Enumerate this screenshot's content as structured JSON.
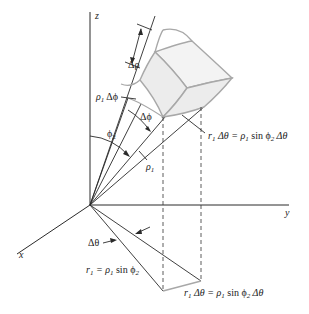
{
  "diagram": {
    "axes": {
      "x_label": "x",
      "y_label": "y",
      "z_label": "z"
    },
    "labels": {
      "delta_rho": "Δρ",
      "rho1_delta_phi_rho": "ρ",
      "rho1_delta_phi_sub": "1",
      "rho1_delta_phi_rest": " Δϕ",
      "delta_phi": "Δϕ",
      "phi2_main": "ϕ",
      "phi2_sub": "2",
      "rho1_main": "ρ",
      "rho1_sub": "1",
      "delta_theta": "Δθ",
      "r1_eq_r": "r",
      "r1_eq_sub1": "1",
      "r1_eq_mid": " = ρ",
      "r1_eq_sub2": "1",
      "r1_eq_sin": " sin ϕ",
      "r1_eq_sub3": "2",
      "arc_upper_r": "r",
      "arc_upper_sub1": "1",
      "arc_upper_mid": " Δθ = ρ",
      "arc_upper_sub2": "1",
      "arc_upper_sin": " sin ϕ",
      "arc_upper_sub3": "2",
      "arc_upper_end": " Δθ",
      "arc_lower_r": "r",
      "arc_lower_sub1": "1",
      "arc_lower_mid": " Δθ = ρ",
      "arc_lower_sub2": "1",
      "arc_lower_sin": " sin ϕ",
      "arc_lower_sub3": "2",
      "arc_lower_end": " Δθ"
    },
    "colors": {
      "line": "#2a2a2a",
      "box_edge": "#a8a8a8",
      "box_fill": "#ececec"
    }
  }
}
